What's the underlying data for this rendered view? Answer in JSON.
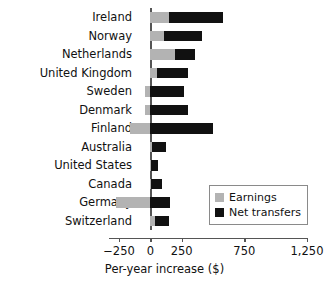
{
  "chart_data": {
    "type": "bar",
    "orientation": "horizontal",
    "stacked": true,
    "title": "",
    "xlabel": "Per-year increase ($)",
    "ylabel": "",
    "xlim": [
      -330,
      1250
    ],
    "xticks": [
      -250,
      0,
      250,
      750,
      1250
    ],
    "xtick_labels": [
      "−250",
      "0",
      "250",
      "750",
      "1,250"
    ],
    "grid": false,
    "legend_position": "bottom-right",
    "categories": [
      "Ireland",
      "Norway",
      "Netherlands",
      "United Kingdom",
      "Sweden",
      "Denmark",
      "Finland",
      "Australia",
      "United States",
      "Canada",
      "Germany",
      "Switzerland"
    ],
    "series": [
      {
        "name": "Earnings",
        "color": "#b3b3b3",
        "values": [
          145,
          105,
          200,
          55,
          -40,
          -45,
          -160,
          15,
          5,
          5,
          -275,
          40
        ]
      },
      {
        "name": "Net transfers",
        "color": "#111111",
        "values": [
          435,
          310,
          160,
          245,
          265,
          300,
          500,
          110,
          60,
          85,
          155,
          105
        ]
      }
    ],
    "totals": [
      580,
      415,
      360,
      300,
      225,
      255,
      340,
      125,
      65,
      90,
      -120,
      145
    ]
  },
  "legend": {
    "items": [
      {
        "label": "Earnings",
        "color": "#b3b3b3"
      },
      {
        "label": "Net transfers",
        "color": "#111111"
      }
    ]
  }
}
